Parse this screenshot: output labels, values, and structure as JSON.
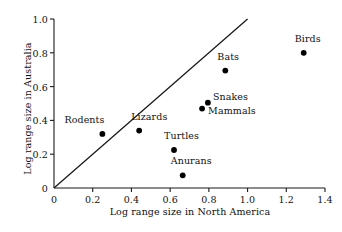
{
  "chart_data": {
    "type": "scatter",
    "title": "",
    "xlabel": "Log range size in North America",
    "ylabel": "Log range size in Australia",
    "xlim": [
      0,
      1.4
    ],
    "ylim": [
      0,
      1.0
    ],
    "xticks": [
      "0",
      "0.2",
      "0.4",
      "0.6",
      "0.8",
      "1.0",
      "1.2",
      "1.4"
    ],
    "xtick_values": [
      0,
      0.2,
      0.4,
      0.6,
      0.8,
      1.0,
      1.2,
      1.4
    ],
    "yticks": [
      "0",
      "0.2",
      "0.4",
      "0.6",
      "0.8",
      "1.0"
    ],
    "ytick_values": [
      0,
      0.2,
      0.4,
      0.6,
      0.8,
      1.0
    ],
    "grid": false,
    "legend": "none",
    "reference_line": {
      "name": "one-to-one-line",
      "x": [
        0,
        1.0
      ],
      "y": [
        0,
        1.0
      ]
    },
    "points": [
      {
        "label": "Rodents",
        "x": 0.25,
        "y": 0.32,
        "label_dx": -38,
        "label_dy": -14
      },
      {
        "label": "Lizards",
        "x": 0.44,
        "y": 0.34,
        "label_dx": -8,
        "label_dy": -14
      },
      {
        "label": "Turtles",
        "x": 0.62,
        "y": 0.225,
        "label_dx": -10,
        "label_dy": -14
      },
      {
        "label": "Anurans",
        "x": 0.665,
        "y": 0.075,
        "label_dx": -12,
        "label_dy": -14
      },
      {
        "label": "Mammals",
        "x": 0.765,
        "y": 0.47,
        "label_dx": 6,
        "label_dy": 2
      },
      {
        "label": "Snakes",
        "x": 0.795,
        "y": 0.505,
        "label_dx": 5,
        "label_dy": -6
      },
      {
        "label": "Bats",
        "x": 0.885,
        "y": 0.695,
        "label_dx": -8,
        "label_dy": -14
      },
      {
        "label": "Birds",
        "x": 1.29,
        "y": 0.8,
        "label_dx": -9,
        "label_dy": -14
      }
    ]
  },
  "axes": {
    "line_color": "#1a1a1a",
    "marker_color": "#000000"
  }
}
